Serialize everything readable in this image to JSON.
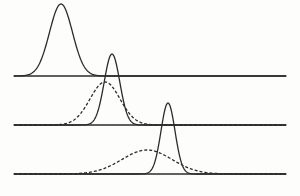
{
  "figure": {
    "title": "",
    "background_color": "#fdfdfb",
    "line_color": "#2b2b2b",
    "width": 300,
    "height": 196
  },
  "chart_data": {
    "type": "line",
    "title": "",
    "subtitle": "",
    "xlabel": "",
    "ylabel": "",
    "xlim": [
      0,
      300
    ],
    "ylim": [
      0,
      196
    ],
    "grid": false,
    "legend": null,
    "panels": [
      {
        "name": "panel-top",
        "baseline_y": 76,
        "baseline_x_start": 14,
        "baseline_x_end": 286,
        "curves": [
          {
            "name": "top-solid-peak",
            "style": "solid",
            "center_x": 61,
            "peak_height": 72,
            "sigma": 11.5,
            "peak_top_y": 4
          }
        ]
      },
      {
        "name": "panel-middle",
        "baseline_y": 125,
        "baseline_x_start": 14,
        "baseline_x_end": 286,
        "curves": [
          {
            "name": "middle-solid-peak",
            "style": "solid",
            "center_x": 112,
            "peak_height": 71,
            "sigma": 7.8,
            "peak_top_y": 54
          },
          {
            "name": "middle-dashed-peak",
            "style": "dashed",
            "center_x": 105,
            "peak_height": 43,
            "sigma": 15.0,
            "peak_top_y": 82
          }
        ]
      },
      {
        "name": "panel-bottom",
        "baseline_y": 174,
        "baseline_x_start": 14,
        "baseline_x_end": 286,
        "curves": [
          {
            "name": "bottom-solid-peak",
            "style": "solid",
            "center_x": 168,
            "peak_height": 71,
            "sigma": 7.0,
            "peak_top_y": 103
          },
          {
            "name": "bottom-dashed-peak",
            "style": "dashed",
            "center_x": 147,
            "peak_height": 24,
            "sigma": 25.0,
            "peak_top_y": 150
          }
        ]
      }
    ],
    "series": [
      {
        "name": "top-solid-peak",
        "panel": 0,
        "style": "solid",
        "center_x": 61,
        "amplitude": 72,
        "sigma": 11.5
      },
      {
        "name": "middle-solid-peak",
        "panel": 1,
        "style": "solid",
        "center_x": 112,
        "amplitude": 71,
        "sigma": 7.8
      },
      {
        "name": "middle-dashed-peak",
        "panel": 1,
        "style": "dashed",
        "center_x": 105,
        "amplitude": 43,
        "sigma": 15.0
      },
      {
        "name": "bottom-solid-peak",
        "panel": 2,
        "style": "solid",
        "center_x": 168,
        "amplitude": 71,
        "sigma": 7.0
      },
      {
        "name": "bottom-dashed-peak",
        "panel": 2,
        "style": "dashed",
        "center_x": 147,
        "amplitude": 24,
        "sigma": 25.0
      }
    ],
    "stroke": {
      "solid_width": 1.3,
      "dashed_width": 1.3,
      "dash_pattern": "3,2",
      "baseline_width": 1.6
    }
  }
}
